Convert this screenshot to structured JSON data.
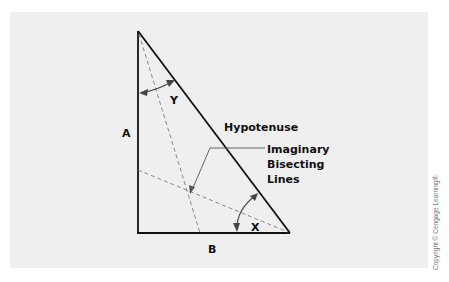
{
  "diagram": {
    "labels": {
      "side_a": "A",
      "side_b": "B",
      "hypotenuse": "Hypotenuse",
      "angle_x": "X",
      "angle_y": "Y",
      "bisect_line1": "Imaginary",
      "bisect_line2": "Bisecting",
      "bisect_line3": "Lines"
    },
    "copyright": "Copyright © Cengage Learning®."
  },
  "colors": {
    "background": "#efefef",
    "lines": "#111111",
    "dashed": "#888888",
    "arrows": "#444444"
  }
}
